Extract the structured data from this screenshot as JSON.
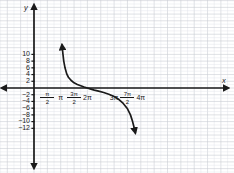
{
  "chart_data": {
    "type": "line",
    "title": "",
    "xlabel": "x",
    "ylabel": "y",
    "grid": true,
    "legend": null,
    "xlim": [
      -0.3926990817,
      14.5
    ],
    "ylim": [
      -13.5,
      13.0
    ],
    "x_axis": {
      "label": "x",
      "ticks": [
        {
          "value": 1.5707963268,
          "label": "π/2",
          "num": "π",
          "den": "2",
          "is_fraction": true
        },
        {
          "value": 3.1415926536,
          "label": "π",
          "is_fraction": false
        },
        {
          "value": 4.7123889804,
          "label": "3π/2",
          "num": "3π",
          "den": "2",
          "is_fraction": true
        },
        {
          "value": 6.2831853072,
          "label": "2π",
          "is_fraction": false
        },
        {
          "value": 9.4247779608,
          "label": "3π",
          "is_fraction": false
        },
        {
          "value": 10.9955742876,
          "label": "7π/2",
          "num": "7π",
          "den": "2",
          "is_fraction": true
        },
        {
          "value": 12.5663706144,
          "label": "4π",
          "is_fraction": false
        }
      ]
    },
    "y_axis": {
      "label": "y",
      "ticks": [
        {
          "value": 10,
          "label": "10"
        },
        {
          "value": 8,
          "label": "8"
        },
        {
          "value": 6,
          "label": "6"
        },
        {
          "value": 4,
          "label": "4"
        },
        {
          "value": 2,
          "label": "2"
        },
        {
          "value": -2,
          "label": "−2"
        },
        {
          "value": -4,
          "label": "−4"
        },
        {
          "value": -6,
          "label": "−6"
        },
        {
          "value": -8,
          "label": "−8"
        },
        {
          "value": -10,
          "label": "−10"
        },
        {
          "value": -12,
          "label": "−12"
        }
      ]
    },
    "series": [
      {
        "name": "cotangent branch",
        "color": "#1a1a1a",
        "asymptotes": [
          3.1415926536,
          12.5663706144
        ],
        "zero_crossing": 6.2831853072,
        "points": [
          {
            "x": 3.3,
            "y": 12.8
          },
          {
            "x": 3.4,
            "y": 10.2
          },
          {
            "x": 3.5,
            "y": 8.0
          },
          {
            "x": 3.65,
            "y": 6.0
          },
          {
            "x": 3.85,
            "y": 4.2
          },
          {
            "x": 4.05,
            "y": 3.2
          },
          {
            "x": 4.35,
            "y": 2.3
          },
          {
            "x": 4.71,
            "y": 1.55
          },
          {
            "x": 5.1,
            "y": 1.05
          },
          {
            "x": 5.5,
            "y": 0.68
          },
          {
            "x": 5.9,
            "y": 0.3
          },
          {
            "x": 6.28,
            "y": 0.0
          },
          {
            "x": 6.7,
            "y": -0.32
          },
          {
            "x": 7.1,
            "y": -0.62
          },
          {
            "x": 7.6,
            "y": -0.95
          },
          {
            "x": 8.2,
            "y": -1.35
          },
          {
            "x": 8.8,
            "y": -1.85
          },
          {
            "x": 9.42,
            "y": -2.55
          },
          {
            "x": 10.0,
            "y": -3.45
          },
          {
            "x": 10.5,
            "y": -4.6
          },
          {
            "x": 11.0,
            "y": -6.2
          },
          {
            "x": 11.35,
            "y": -8.0
          },
          {
            "x": 11.6,
            "y": -10.0
          },
          {
            "x": 11.8,
            "y": -12.0
          },
          {
            "x": 11.92,
            "y": -13.3
          }
        ]
      }
    ],
    "colors": {
      "curve": "#1a1a1a",
      "axis": "#1a1a1a",
      "grid_major": "#c9cdd4",
      "grid_minor": "#e2e5ea",
      "background": "#ffffff"
    }
  }
}
